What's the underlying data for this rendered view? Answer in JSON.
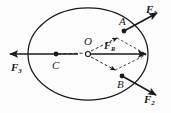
{
  "figure": {
    "background_color": "#fdfdfd",
    "stroke_color": "#1a1a1a",
    "points": {
      "O": {
        "label": "O",
        "x": 88,
        "y": 53,
        "marker": "open-circle"
      },
      "C": {
        "label": "C",
        "x": 56,
        "y": 55,
        "marker": "filled-dot"
      },
      "A": {
        "label": "A",
        "x": 124,
        "y": 31,
        "marker": "filled-dot"
      },
      "B": {
        "label": "B",
        "x": 122,
        "y": 76,
        "marker": "filled-dot"
      }
    },
    "vectors": {
      "F1": {
        "label": "F",
        "subscript": "1",
        "label_x": 146,
        "label_y": 5
      },
      "F2": {
        "label": "F",
        "subscript": "2",
        "label_x": 145,
        "label_y": 95
      },
      "F3": {
        "label": "F",
        "subscript": "3",
        "label_x": 12,
        "label_y": 62
      },
      "FR": {
        "label": "F",
        "subscript": "R",
        "label_x": 104,
        "label_y": 43
      }
    },
    "ellipse": {
      "center_x": 88,
      "center_y": 54,
      "radius_x": 60,
      "radius_y": 46
    }
  }
}
